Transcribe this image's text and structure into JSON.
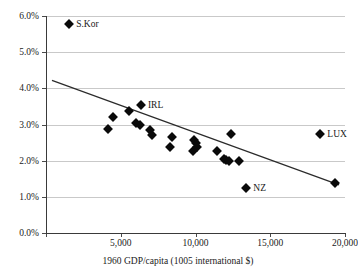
{
  "title": "Convergence: growth vs. initial GDP/capita, 1960-2000",
  "chart_data": {
    "type": "scatter",
    "title": "Convergence: growth vs. initial GDP/capita, 1960-2000",
    "xlabel": "1960 GDP/capita (1005 international $)",
    "ylabel": "",
    "xlim": [
      0,
      20000
    ],
    "ylim": [
      0,
      0.06
    ],
    "grid": true,
    "legend": "none",
    "xticks": [
      0,
      5000,
      10000,
      15000,
      20000
    ],
    "xticklabels": [
      "",
      "5,000",
      "10,000",
      "15,000",
      "20,000"
    ],
    "yticks": [
      0.0,
      0.01,
      0.02,
      0.03,
      0.04,
      0.05,
      0.06
    ],
    "yticklabels": [
      "0.0%",
      "1.0%",
      "2.0%",
      "3.0%",
      "4.0%",
      "5.0%",
      "6.0%"
    ],
    "marker": "diamond",
    "marker_color": "#0a0a0a",
    "trendline": {
      "type": "linear",
      "x": [
        400,
        19600
      ],
      "y": [
        0.0422,
        0.0133
      ],
      "color": "#2b2b2b"
    },
    "points": [
      {
        "label": "S.Kor",
        "x": 1550,
        "y": 0.0577,
        "label_pos": "right"
      },
      {
        "label": "",
        "x": 4150,
        "y": 0.0288,
        "label_pos": "none"
      },
      {
        "label": "",
        "x": 4500,
        "y": 0.032,
        "label_pos": "none"
      },
      {
        "label": "",
        "x": 5550,
        "y": 0.0338,
        "label_pos": "none"
      },
      {
        "label": "IRL",
        "x": 6350,
        "y": 0.0355,
        "label_pos": "right"
      },
      {
        "label": "",
        "x": 6050,
        "y": 0.0303,
        "label_pos": "none"
      },
      {
        "label": "",
        "x": 6300,
        "y": 0.03,
        "label_pos": "none"
      },
      {
        "label": "",
        "x": 6950,
        "y": 0.0286,
        "label_pos": "none"
      },
      {
        "label": "",
        "x": 7100,
        "y": 0.0271,
        "label_pos": "none"
      },
      {
        "label": "",
        "x": 8450,
        "y": 0.0265,
        "label_pos": "none"
      },
      {
        "label": "",
        "x": 8300,
        "y": 0.0238,
        "label_pos": "none"
      },
      {
        "label": "",
        "x": 9900,
        "y": 0.0256,
        "label_pos": "none"
      },
      {
        "label": "",
        "x": 10050,
        "y": 0.0249,
        "label_pos": "none"
      },
      {
        "label": "",
        "x": 9800,
        "y": 0.0228,
        "label_pos": "none"
      },
      {
        "label": "",
        "x": 10100,
        "y": 0.0237,
        "label_pos": "none"
      },
      {
        "label": "",
        "x": 11450,
        "y": 0.0226,
        "label_pos": "none"
      },
      {
        "label": "",
        "x": 11900,
        "y": 0.0205,
        "label_pos": "none"
      },
      {
        "label": "",
        "x": 12050,
        "y": 0.0202,
        "label_pos": "none"
      },
      {
        "label": "",
        "x": 12250,
        "y": 0.02,
        "label_pos": "none"
      },
      {
        "label": "",
        "x": 12900,
        "y": 0.0199,
        "label_pos": "none"
      },
      {
        "label": "",
        "x": 12350,
        "y": 0.0274,
        "label_pos": "none"
      },
      {
        "label": "NZ",
        "x": 13400,
        "y": 0.0125,
        "label_pos": "right"
      },
      {
        "label": "LUX",
        "x": 18350,
        "y": 0.0273,
        "label_pos": "right"
      },
      {
        "label": "",
        "x": 19350,
        "y": 0.0137,
        "label_pos": "none"
      }
    ]
  }
}
